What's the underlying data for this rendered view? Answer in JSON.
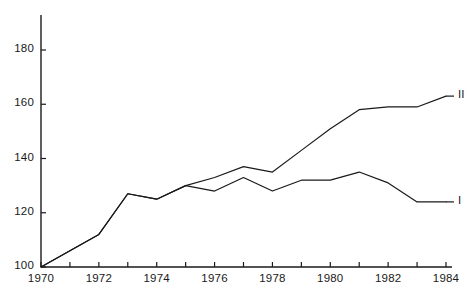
{
  "chart_data": {
    "type": "line",
    "title": "",
    "subtitle": "",
    "xlabel": "",
    "ylabel": "",
    "x": [
      1970,
      1971,
      1972,
      1973,
      1974,
      1975,
      1976,
      1977,
      1978,
      1979,
      1980,
      1981,
      1982,
      1983,
      1984
    ],
    "xlim": [
      1970,
      1984
    ],
    "ylim": [
      100,
      190
    ],
    "xticks": [
      1970,
      1971,
      1972,
      1973,
      1974,
      1975,
      1976,
      1977,
      1978,
      1979,
      1980,
      1981,
      1982,
      1983,
      1984
    ],
    "xtick_labels": [
      "1970",
      "",
      "1972",
      "",
      "1974",
      "",
      "1976",
      "",
      "1978",
      "",
      "1980",
      "",
      "1982",
      "",
      "1984"
    ],
    "yticks": [
      100,
      120,
      140,
      160,
      180
    ],
    "ytick_labels": [
      "100",
      "120",
      "140",
      "160",
      "180"
    ],
    "grid": false,
    "legend_position": "line-end-right",
    "line_color": "#1a1a1a",
    "axis_color": "#1a1a1a",
    "series": [
      {
        "name": "II",
        "label": "II",
        "values": [
          100,
          106,
          112,
          127,
          125,
          130,
          133,
          137,
          135,
          143,
          151,
          158,
          159,
          159,
          163
        ]
      },
      {
        "name": "I",
        "label": "I",
        "values": [
          100,
          106,
          112,
          127,
          125,
          130,
          128,
          133,
          128,
          132,
          132,
          135,
          131,
          124,
          124
        ]
      }
    ],
    "shared_segment_years": [
      1970,
      1971,
      1972,
      1973,
      1974,
      1975
    ]
  }
}
